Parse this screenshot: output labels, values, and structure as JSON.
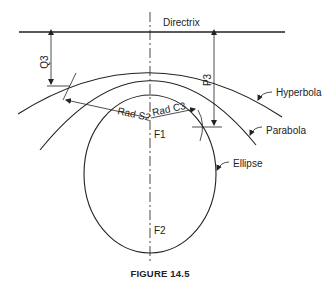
{
  "figure": {
    "caption": "FIGURE 14.5",
    "labels": {
      "directrix": "Directrix",
      "q3": "Q3",
      "p3": "P3",
      "hyperbola": "Hyperbola",
      "parabola": "Parabola",
      "ellipse": "Ellipse",
      "rad_s2": "Rad S2",
      "rad_c3": "Rad C3",
      "f1": "F1",
      "f2": "F2"
    },
    "colors": {
      "line": "#222222",
      "background": "#ffffff"
    }
  }
}
